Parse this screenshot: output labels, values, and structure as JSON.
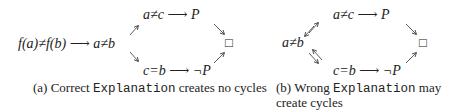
{
  "panel_a": {
    "start_node": "f(a)≠f(b)",
    "arrow": "⟶",
    "mid_node": "a≠b",
    "top_node_left": "a≠c",
    "top_node_right": "P",
    "bottom_node_left": "c=b",
    "bottom_node_right": "¬P",
    "end_node": "□",
    "caption_prefix": "(a) Correct ",
    "caption_code": "Explanation",
    "caption_suffix": " creates no cycles"
  },
  "panel_b": {
    "mid_node": "a≠b",
    "arrow": "⟶",
    "top_node_left": "a≠c",
    "top_node_right": "P",
    "bottom_node_left": "c=b",
    "bottom_node_right": "¬P",
    "end_node": "□",
    "caption_prefix": "(b) Wrong ",
    "caption_code": "Explanation",
    "caption_suffix": " may",
    "caption_line2": "create cycles"
  }
}
